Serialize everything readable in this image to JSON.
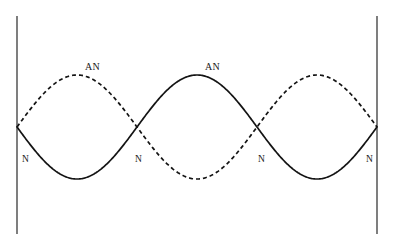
{
  "figure": {
    "background_color": "#ffffff",
    "stroke_color": "#1a1a1a",
    "width": 393,
    "height": 248
  },
  "boundaries": {
    "left_wall": {
      "x": 17,
      "y_top": 16,
      "y_bottom": 234
    },
    "right_wall": {
      "x": 377,
      "y_top": 16,
      "y_bottom": 234
    }
  },
  "axis": {
    "baseline_y": 127,
    "x_start": 17,
    "x_end": 377,
    "amplitude": 52,
    "wavelength": 240,
    "cycles": 1.5
  },
  "curves": [
    {
      "name": "solid-wave",
      "style": "solid",
      "phase": "negative-first",
      "stroke_width": 1.6,
      "dash": "none"
    },
    {
      "name": "dashed-wave",
      "style": "dashed",
      "phase": "positive-first",
      "stroke_width": 1.6,
      "dash": "4 3"
    }
  ],
  "labels": {
    "antinodes": [
      {
        "text": "AN",
        "x": 85,
        "y": 62,
        "belongs_to": "dashed-wave"
      },
      {
        "text": "AN",
        "x": 205,
        "y": 62,
        "belongs_to": "solid-wave"
      }
    ],
    "nodes": [
      {
        "text": "N",
        "x": 22,
        "y": 155
      },
      {
        "text": "N",
        "x": 135,
        "y": 155
      },
      {
        "text": "N",
        "x": 258,
        "y": 155
      },
      {
        "text": "N",
        "x": 366,
        "y": 155
      }
    ]
  },
  "chart_data": {
    "type": "line",
    "title": "",
    "xlabel": "",
    "ylabel": "",
    "x_range": [
      17,
      377
    ],
    "y_range": [
      75,
      179
    ],
    "grid": false,
    "legend": "none",
    "node_positions_x": [
      17,
      137,
      257,
      377
    ],
    "antinode_positions_x": [
      77,
      197,
      317
    ],
    "series": [
      {
        "name": "solid-wave",
        "style": "solid",
        "amplitude": 52,
        "wavelength": 240,
        "description": "y = baseline + A*sin(2*pi*(x-17)/240)"
      },
      {
        "name": "dashed-wave",
        "style": "dashed",
        "amplitude": 52,
        "wavelength": 240,
        "description": "y = baseline - A*sin(2*pi*(x-17)/240)"
      }
    ]
  }
}
